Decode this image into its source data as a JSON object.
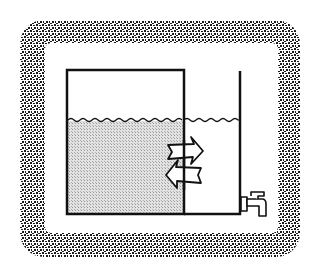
{
  "diagram": {
    "title": "",
    "colors": {
      "background": "#ffffff",
      "stroke": "#111111",
      "water_fill": "#d6d6d6",
      "frame_stipple": "#1a1a1a"
    },
    "frame": {
      "outer": [
        20,
        20,
        300,
        257
      ],
      "inner": [
        45,
        43,
        278,
        233
      ],
      "corner_radius": 22
    },
    "left_tank": {
      "x1": 67,
      "x2": 184,
      "top": 70,
      "bottom": 214,
      "water_level": 120,
      "filled": true
    },
    "right_tank": {
      "x1": 184,
      "x2": 241,
      "top": 71,
      "bottom": 214,
      "water_level": 120,
      "filled": false
    },
    "arrows": [
      {
        "direction": "right",
        "label": ""
      },
      {
        "direction": "left",
        "label": ""
      }
    ],
    "icons": [
      "faucet-icon",
      "arrow-right-icon",
      "arrow-left-icon"
    ]
  }
}
